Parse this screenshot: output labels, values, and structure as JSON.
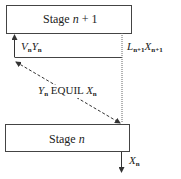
{
  "diagram": {
    "top_stage": {
      "label_prefix": "Stage ",
      "label_var": "n",
      "label_suffix": " + 1"
    },
    "bottom_stage": {
      "label_prefix": "Stage ",
      "label_var": "n"
    },
    "vapor_stream": {
      "v": "V",
      "v_sub": "n",
      "y": "Y",
      "y_sub": "n"
    },
    "liquid_stream": {
      "l": "L",
      "l_sub": "n+1",
      "x": "X",
      "x_sub": "n+1"
    },
    "equilibrium": {
      "y": "Y",
      "y_sub": "n",
      "text": " EQUIL ",
      "x": "X",
      "x_sub": "n"
    },
    "outlet": {
      "x": "X",
      "x_sub": "n"
    },
    "colors": {
      "line": "#333333",
      "box_fill": "#ffffff",
      "text": "#222222"
    }
  }
}
